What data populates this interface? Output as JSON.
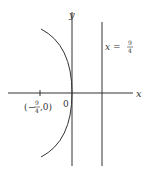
{
  "figure": {
    "type": "parabola-directrix-diagram",
    "axes": {
      "x_label": "x",
      "y_label": "y",
      "origin_label": "0"
    },
    "directrix": {
      "label_var": "x",
      "label_eq": "=",
      "label_num": "9",
      "label_den": "4"
    },
    "focus_point": {
      "open_paren": "(",
      "minus": "−",
      "num": "9",
      "den": "4",
      "rest": ",0)"
    },
    "curve": {
      "description": "parabola opening left with vertex at origin",
      "equation": "y^2 = -9x"
    },
    "colors": {
      "stroke": "#333333",
      "background": "#ffffff"
    }
  }
}
